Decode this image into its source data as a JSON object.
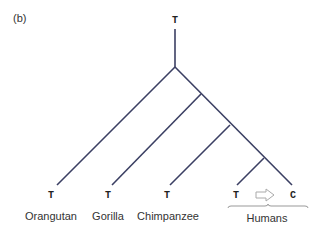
{
  "panel_label": "(b)",
  "root": {
    "base": "T"
  },
  "colors": {
    "branch": "#3b3f63",
    "arrow": "#aaaaaa",
    "bracket": "#999999"
  },
  "leaves": [
    {
      "species": "Orangutan",
      "base": "T"
    },
    {
      "species": "Gorilla",
      "base": "T"
    },
    {
      "species": "Chimpanzee",
      "base": "T"
    },
    {
      "species": "",
      "base": "T"
    },
    {
      "species": "",
      "base": "C"
    }
  ],
  "humans_label": "Humans",
  "mutation": {
    "from": "T",
    "to": "C",
    "arrow": "right-arrow-outline"
  }
}
